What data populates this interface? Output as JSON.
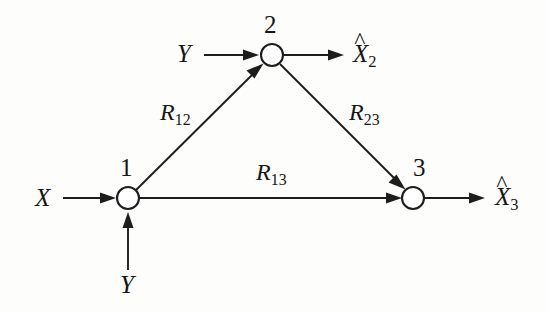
{
  "figure": {
    "type": "directed-graph",
    "background_color": "#fdfdfc",
    "ink_color": "#1d1d1d"
  },
  "nodes": [
    {
      "id": "1",
      "label": "1",
      "cx": 128,
      "cy": 198,
      "r": 11
    },
    {
      "id": "2",
      "label": "2",
      "cx": 272,
      "cy": 55,
      "r": 11
    },
    {
      "id": "3",
      "label": "3",
      "cx": 413,
      "cy": 198,
      "r": 11
    }
  ],
  "edges": [
    {
      "id": "e12",
      "from": "1",
      "to": "2",
      "label": "R",
      "sub": "12"
    },
    {
      "id": "e23",
      "from": "2",
      "to": "3",
      "label": "R",
      "sub": "23"
    },
    {
      "id": "e13",
      "from": "1",
      "to": "3",
      "label": "R",
      "sub": "13"
    }
  ],
  "inputs": [
    {
      "id": "x-in",
      "label": "X",
      "target": "1",
      "direction": "left-to-right"
    },
    {
      "id": "y-in-node1",
      "label": "Y",
      "target": "1",
      "direction": "bottom-to-top"
    },
    {
      "id": "y-in-node2",
      "label": "Y",
      "target": "2",
      "direction": "left-to-right"
    }
  ],
  "outputs": [
    {
      "id": "xhat2",
      "base": "X",
      "hat": "^",
      "sub": "2",
      "source": "2"
    },
    {
      "id": "xhat3",
      "base": "X",
      "hat": "^",
      "sub": "3",
      "source": "3"
    }
  ],
  "labels": {
    "node1": "1",
    "node2": "2",
    "node3": "3",
    "x_input": "X",
    "y_input_node1": "Y",
    "y_input_node2": "Y",
    "r12_base": "R",
    "r12_sub": "12",
    "r23_base": "R",
    "r23_sub": "23",
    "r13_base": "R",
    "r13_sub": "13",
    "xhat2_base": "X",
    "xhat2_sub": "2",
    "xhat3_base": "X",
    "xhat3_sub": "3",
    "hat_mark_2": "^",
    "hat_mark_3": "^"
  }
}
